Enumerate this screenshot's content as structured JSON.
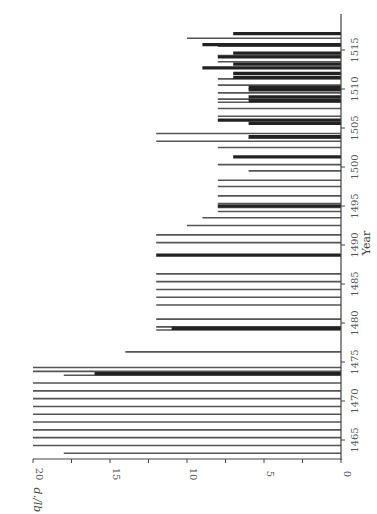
{
  "chart_data": {
    "type": "bar",
    "orientation": "rotated-90-clockwise",
    "title": "",
    "xlabel": "Year",
    "ylabel": "d./lb",
    "ylim": [
      0,
      20
    ],
    "xlim": [
      1462,
      1518
    ],
    "y_ticks": [
      0,
      5,
      10,
      15,
      20
    ],
    "y_tick_labels": [
      "0",
      "5",
      "10",
      "15",
      "20"
    ],
    "x_ticks": [
      1465,
      1470,
      1475,
      1480,
      1485,
      1490,
      1495,
      1500,
      1505,
      1510,
      1515
    ],
    "x_tick_labels": [
      "1465",
      "1470",
      "1475",
      "1480",
      "1485",
      "1490",
      "1495",
      "1500",
      "1505",
      "1510",
      "1515"
    ],
    "grid": false,
    "legend": null,
    "series": [
      {
        "name": "thin bars (price)",
        "style": "thin",
        "points": [
          {
            "x": 1463.3,
            "y": 18
          },
          {
            "x": 1464.3,
            "y": 20
          },
          {
            "x": 1465.3,
            "y": 20
          },
          {
            "x": 1466.3,
            "y": 20
          },
          {
            "x": 1467.3,
            "y": 20
          },
          {
            "x": 1468.3,
            "y": 20
          },
          {
            "x": 1469.3,
            "y": 20
          },
          {
            "x": 1470.3,
            "y": 20
          },
          {
            "x": 1471.3,
            "y": 20
          },
          {
            "x": 1472.3,
            "y": 20
          },
          {
            "x": 1473.3,
            "y": 18
          },
          {
            "x": 1473.8,
            "y": 20
          },
          {
            "x": 1474.3,
            "y": 20
          },
          {
            "x": 1476.3,
            "y": 14
          },
          {
            "x": 1479.1,
            "y": 12
          },
          {
            "x": 1479.5,
            "y": 12
          },
          {
            "x": 1480.5,
            "y": 12
          },
          {
            "x": 1482.3,
            "y": 12
          },
          {
            "x": 1483.3,
            "y": 12
          },
          {
            "x": 1484.3,
            "y": 12
          },
          {
            "x": 1485.3,
            "y": 12
          },
          {
            "x": 1486.3,
            "y": 12
          },
          {
            "x": 1490.3,
            "y": 12
          },
          {
            "x": 1491.3,
            "y": 12
          },
          {
            "x": 1492.5,
            "y": 10
          },
          {
            "x": 1493.5,
            "y": 9
          },
          {
            "x": 1494.3,
            "y": 8
          },
          {
            "x": 1494.8,
            "y": 8
          },
          {
            "x": 1495.3,
            "y": 8
          },
          {
            "x": 1496.3,
            "y": 8
          },
          {
            "x": 1497.5,
            "y": 8
          },
          {
            "x": 1498.3,
            "y": 8
          },
          {
            "x": 1499.5,
            "y": 6
          },
          {
            "x": 1500.3,
            "y": 8
          },
          {
            "x": 1502.5,
            "y": 8
          },
          {
            "x": 1503.3,
            "y": 12
          },
          {
            "x": 1503.7,
            "y": 6
          },
          {
            "x": 1504.3,
            "y": 12
          },
          {
            "x": 1506.5,
            "y": 8
          },
          {
            "x": 1507.5,
            "y": 8
          },
          {
            "x": 1508.3,
            "y": 8
          },
          {
            "x": 1508.7,
            "y": 8
          },
          {
            "x": 1509.5,
            "y": 8
          },
          {
            "x": 1510.5,
            "y": 8
          },
          {
            "x": 1511.3,
            "y": 8
          },
          {
            "x": 1513.5,
            "y": 8
          },
          {
            "x": 1514.3,
            "y": 8
          },
          {
            "x": 1515.5,
            "y": 8
          },
          {
            "x": 1516.5,
            "y": 10
          }
        ]
      },
      {
        "name": "thick bars (price)",
        "style": "thick",
        "points": [
          {
            "x": 1473.5,
            "y": 16
          },
          {
            "x": 1479.3,
            "y": 11
          },
          {
            "x": 1488.7,
            "y": 12
          },
          {
            "x": 1495.0,
            "y": 8
          },
          {
            "x": 1501.3,
            "y": 7
          },
          {
            "x": 1503.9,
            "y": 6
          },
          {
            "x": 1505.6,
            "y": 6
          },
          {
            "x": 1506.0,
            "y": 8
          },
          {
            "x": 1508.5,
            "y": 6
          },
          {
            "x": 1509.0,
            "y": 6
          },
          {
            "x": 1509.9,
            "y": 6
          },
          {
            "x": 1510.2,
            "y": 6
          },
          {
            "x": 1511.5,
            "y": 7
          },
          {
            "x": 1512.0,
            "y": 7
          },
          {
            "x": 1512.7,
            "y": 9
          },
          {
            "x": 1513.2,
            "y": 7
          },
          {
            "x": 1514.1,
            "y": 8
          },
          {
            "x": 1514.6,
            "y": 7
          },
          {
            "x": 1515.7,
            "y": 9
          },
          {
            "x": 1517.1,
            "y": 7
          }
        ]
      }
    ]
  },
  "axes": {
    "value_axis_title": "d./lb",
    "year_axis_title": "Year"
  }
}
